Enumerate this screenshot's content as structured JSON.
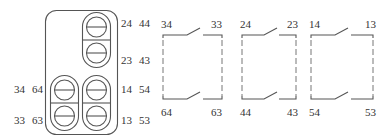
{
  "colors": {
    "line": "#555555",
    "text": "#333333",
    "background": "#ffffff"
  },
  "terminal_block": {
    "left_labels": [
      {
        "id": "l34",
        "text": "34"
      },
      {
        "id": "l64",
        "text": "64"
      },
      {
        "id": "l33",
        "text": "33"
      },
      {
        "id": "l63",
        "text": "63"
      }
    ],
    "right_labels": [
      {
        "id": "r24",
        "text": "24"
      },
      {
        "id": "r44",
        "text": "44"
      },
      {
        "id": "r23",
        "text": "23"
      },
      {
        "id": "r43",
        "text": "43"
      },
      {
        "id": "r14",
        "text": "14"
      },
      {
        "id": "r54",
        "text": "54"
      },
      {
        "id": "r13",
        "text": "13"
      },
      {
        "id": "r53",
        "text": "53"
      }
    ]
  },
  "contacts": [
    {
      "name": "contact-group-1",
      "top_left": "34",
      "top_right": "33",
      "bottom_left": "64",
      "bottom_right": "63"
    },
    {
      "name": "contact-group-2",
      "top_left": "24",
      "top_right": "23",
      "bottom_left": "44",
      "bottom_right": "43"
    },
    {
      "name": "contact-group-3",
      "top_left": "14",
      "top_right": "13",
      "bottom_left": "54",
      "bottom_right": "53"
    }
  ]
}
